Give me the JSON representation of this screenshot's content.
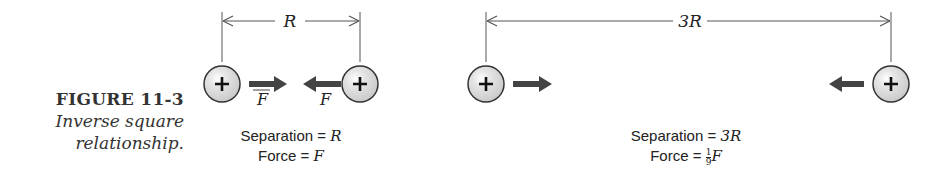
{
  "caption": {
    "figure_number": "FIGURE 11-3",
    "description_line1": "Inverse square",
    "description_line2": "relationship."
  },
  "panels": [
    {
      "name": "close",
      "dimension_label": "R",
      "force_label_left": "F",
      "force_label_right": "F",
      "charge_sign": "+",
      "separation_text": "Separation = ",
      "separation_value": "R",
      "force_text": "Force = ",
      "force_value": "F"
    },
    {
      "name": "far",
      "dimension_label": "3R",
      "charge_sign": "+",
      "separation_text": "Separation = ",
      "separation_value": "3R",
      "force_text": "Force = ",
      "force_fraction_numerator": "1",
      "force_fraction_denominator": "9",
      "force_value": "F"
    }
  ],
  "colors": {
    "charge_fill": "#dcdcdc",
    "charge_stroke": "#333333",
    "arrow": "#444444",
    "line": "#555555",
    "text": "#222222"
  }
}
